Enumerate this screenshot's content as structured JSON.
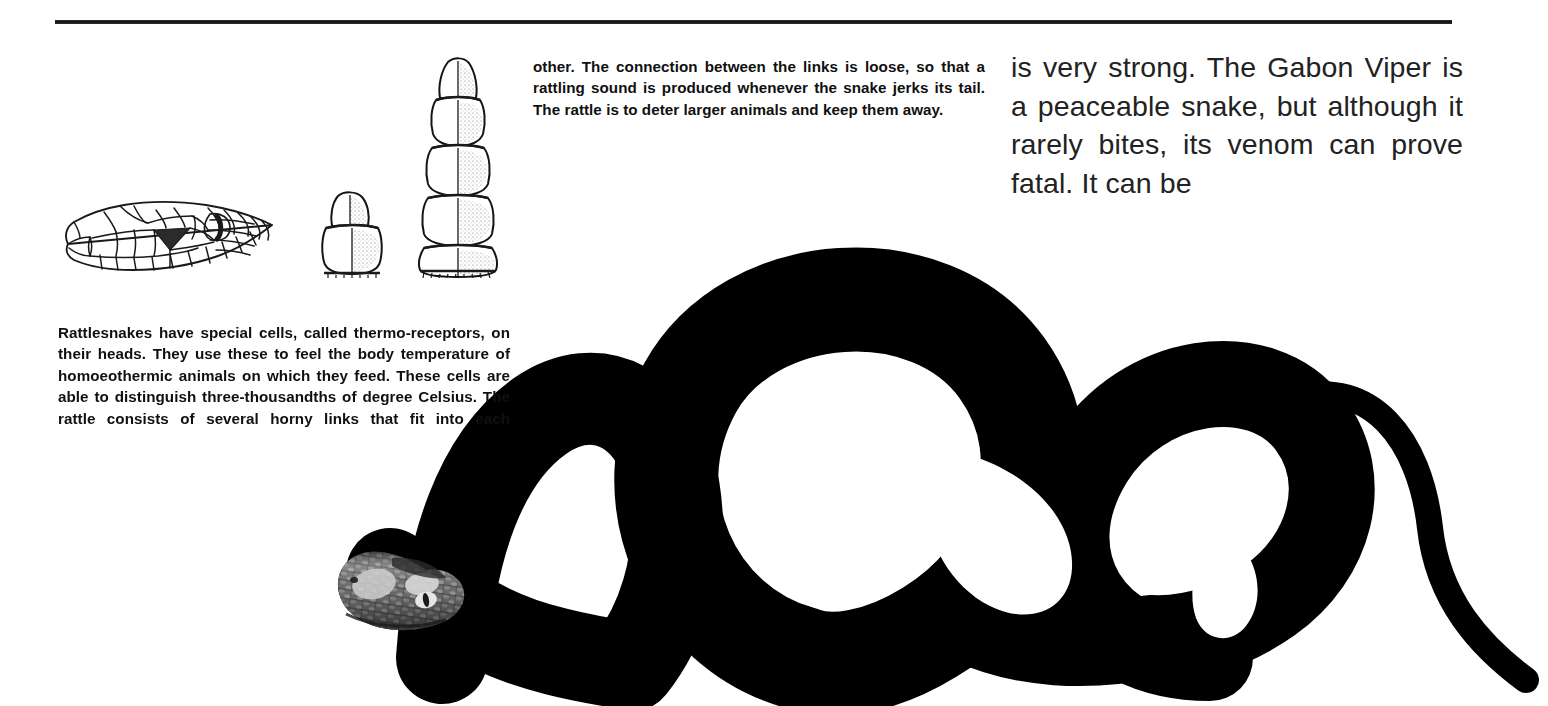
{
  "page": {
    "background_color": "#ffffff",
    "ink_color": "#101010",
    "rule_color": "#111111"
  },
  "columns": {
    "middle": {
      "id": "rattle-continuation-column",
      "text": "other. The connection between the links is loose, so that a rattling sound is produced whenever the snake jerks its tail. The rattle is to deter larger animals and keep them away.",
      "lines": [
        "other. The connection between the links is loose,",
        "so that a rattling sound is produced whenever the",
        "snake jerks its tail. The rattle is to deter larger",
        "animals and keep them away."
      ]
    },
    "right": {
      "id": "gabon-viper-column",
      "text": "is very strong. The Gabon Viper is a peaceable snake, but although it rarely bites, its venom can prove fatal. It can be",
      "lines": [
        "is very strong. The Gabon Vi-",
        "per is a peaceable snake, but",
        "although it rarely bites, its ve-",
        "nom can prove fatal. It can be"
      ]
    },
    "left": {
      "id": "rattlesnake-thermoreceptors-column",
      "text": "Rattlesnakes have special cells, called thermo-receptors, on their heads. They use these to feel the body temperature of homoeothermic animals on which they feed. These cells are able to distinguish three-thousandths of degree Celsius. The rattle consists of several horny links that fit into each",
      "lines": [
        "Rattlesnakes have special cells, called thermo-",
        "receptors, on their heads. They use these to feel the",
        "body temperature of homoeothermic animals on",
        "which they feed. These cells are able to distinguish",
        "three-thousandths of degree Celsius. The rattle",
        "consists of several horny links that fit into each"
      ]
    }
  },
  "figures": {
    "snake_head_diagram": {
      "name": "snake-head-line-drawing",
      "description": "Line drawing of a pit viper head in left profile showing scale pattern, vertical slit eye and dark triangular heat-sensing pit",
      "caption": ""
    },
    "rattle_small": {
      "name": "rattle-two-segment-diagram",
      "description": "Line drawing of a young rattle with a pointed button and one segment",
      "segments": 2
    },
    "rattle_large": {
      "name": "rattle-five-segment-diagram",
      "description": "Line drawing of a mature rattle with a pointed button and four widening horny links",
      "segments": 5
    },
    "snake_photo": {
      "name": "gabon-viper-photograph",
      "description": "Black and white photograph of a coiled Gabon Viper, head at lower left, body forming a tall hump and two large loops, slender tail curving to the lower right",
      "tone": "grayscale halftone"
    }
  }
}
